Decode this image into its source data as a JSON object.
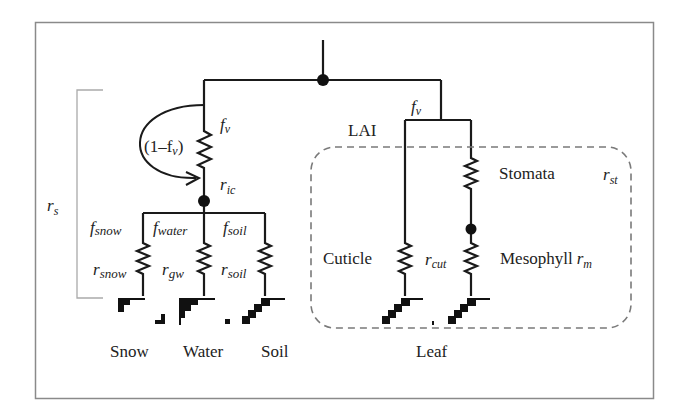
{
  "diagram": {
    "type": "resistance-network",
    "frame_color": "#8a8a8a",
    "line_color": "#1a1a1a",
    "dashed_color": "#7a7a7a",
    "canopy_branch": {
      "fraction_label": "f",
      "fraction_sub": "v",
      "bypass_label": "(1–f",
      "bypass_sub": "v",
      "bypass_close": ")",
      "resistance_label": "r",
      "resistance_sub": "ic"
    },
    "surface_resistance_label": "r",
    "surface_resistance_sub": "s",
    "ground_branches": [
      {
        "fraction": "f",
        "fraction_sub": "snow",
        "resistance": "r",
        "resistance_sub": "snow",
        "surface": "Snow"
      },
      {
        "fraction": "f",
        "fraction_sub": "water",
        "resistance": "r",
        "resistance_sub": "gw",
        "surface": "Water"
      },
      {
        "fraction": "f",
        "fraction_sub": "soil",
        "resistance": "r",
        "resistance_sub": "soil",
        "surface": "Soil"
      }
    ],
    "leaf_branch": {
      "fraction_label": "f",
      "fraction_sub": "v",
      "lai_label": "LAI",
      "stomata_label": "Stomata",
      "stomata_resistance": "r",
      "stomata_resistance_sub": "st",
      "cuticle_label": "Cuticle",
      "cuticle_resistance": "r",
      "cuticle_resistance_sub": "cut",
      "mesophyll_label": "Mesophyll",
      "mesophyll_resistance": "r",
      "mesophyll_resistance_sub": "m",
      "surface": "Leaf"
    }
  }
}
